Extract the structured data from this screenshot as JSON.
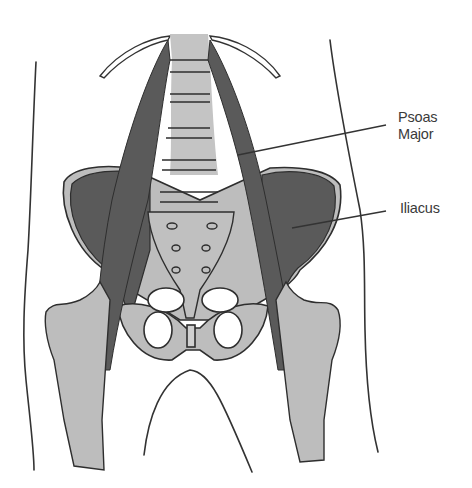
{
  "figure": {
    "colors": {
      "background": "#ffffff",
      "muscle": "#5a5a5a",
      "bone": "#bdbdbd",
      "outline": "#2e2e2e",
      "label_text": "#3a3a3a"
    }
  },
  "labels": [
    {
      "id": "psoas-major",
      "line1": "Psoas",
      "line2": "Major"
    },
    {
      "id": "iliacus",
      "line1": "Iliacus"
    }
  ]
}
